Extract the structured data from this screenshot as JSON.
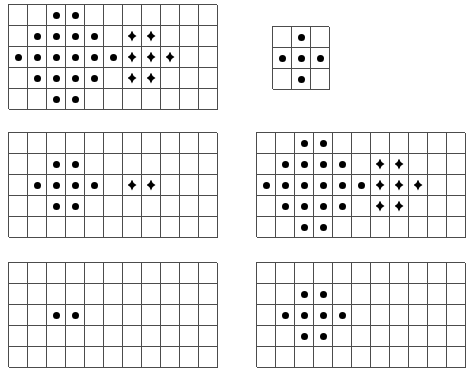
{
  "page": {
    "background_color": "#ffffff",
    "grid_line_color": "#4c4c4c",
    "marker_color": "#000000",
    "marker_types": [
      "dot",
      "diamond"
    ],
    "grid_count": 6
  },
  "legend": {
    "dot_label": "round-dot",
    "diamond_label": "diamond",
    "empty_label": "empty"
  },
  "grids": [
    {
      "name": "grid-top-left",
      "position": "top-left",
      "x": 8,
      "y": 4,
      "cols": 11,
      "rows": 5,
      "cell_w": 19,
      "cell_h": 21,
      "cells": [
        [
          "",
          "",
          "dot",
          "dot",
          "",
          "",
          "",
          "",
          "",
          "",
          ""
        ],
        [
          "",
          "dot",
          "dot",
          "dot",
          "dot",
          "",
          "diamond",
          "diamond",
          "",
          "",
          ""
        ],
        [
          "dot",
          "dot",
          "dot",
          "dot",
          "dot",
          "dot",
          "diamond",
          "diamond",
          "diamond",
          "",
          ""
        ],
        [
          "",
          "dot",
          "dot",
          "dot",
          "dot",
          "",
          "diamond",
          "diamond",
          "",
          "",
          ""
        ],
        [
          "",
          "",
          "dot",
          "dot",
          "",
          "",
          "",
          "",
          "",
          "",
          ""
        ]
      ],
      "dot_count": 18,
      "diamond_count": 7
    },
    {
      "name": "grid-top-right",
      "position": "top-right",
      "x": 272,
      "y": 26,
      "cols": 3,
      "rows": 3,
      "cell_w": 19,
      "cell_h": 21,
      "cells": [
        [
          "",
          "dot",
          ""
        ],
        [
          "dot",
          "dot",
          "dot"
        ],
        [
          "",
          "dot",
          ""
        ]
      ],
      "dot_count": 5,
      "diamond_count": 0
    },
    {
      "name": "grid-middle-left",
      "position": "middle-left",
      "x": 8,
      "y": 132,
      "cols": 11,
      "rows": 5,
      "cell_w": 19,
      "cell_h": 21,
      "cells": [
        [
          "",
          "",
          "",
          "",
          "",
          "",
          "",
          "",
          "",
          "",
          ""
        ],
        [
          "",
          "",
          "dot",
          "dot",
          "",
          "",
          "",
          "",
          "",
          "",
          ""
        ],
        [
          "",
          "dot",
          "dot",
          "dot",
          "dot",
          "",
          "diamond",
          "diamond",
          "",
          "",
          ""
        ],
        [
          "",
          "",
          "dot",
          "dot",
          "",
          "",
          "",
          "",
          "",
          "",
          ""
        ],
        [
          "",
          "",
          "",
          "",
          "",
          "",
          "",
          "",
          "",
          "",
          ""
        ]
      ],
      "dot_count": 8,
      "diamond_count": 2
    },
    {
      "name": "grid-middle-right",
      "position": "middle-right",
      "x": 256,
      "y": 132,
      "cols": 11,
      "rows": 5,
      "cell_w": 19,
      "cell_h": 21,
      "cells": [
        [
          "",
          "",
          "dot",
          "dot",
          "",
          "",
          "",
          "",
          "",
          "",
          ""
        ],
        [
          "",
          "dot",
          "dot",
          "dot",
          "dot",
          "",
          "diamond",
          "diamond",
          "",
          "",
          ""
        ],
        [
          "dot",
          "dot",
          "dot",
          "dot",
          "dot",
          "dot",
          "diamond",
          "diamond",
          "diamond",
          "",
          ""
        ],
        [
          "",
          "dot",
          "dot",
          "dot",
          "dot",
          "",
          "diamond",
          "diamond",
          "",
          "",
          ""
        ],
        [
          "",
          "",
          "dot",
          "dot",
          "",
          "",
          "",
          "",
          "",
          "",
          ""
        ]
      ],
      "dot_count": 18,
      "diamond_count": 7
    },
    {
      "name": "grid-bottom-left",
      "position": "bottom-left",
      "x": 8,
      "y": 262,
      "cols": 11,
      "rows": 5,
      "cell_w": 19,
      "cell_h": 21,
      "cells": [
        [
          "",
          "",
          "",
          "",
          "",
          "",
          "",
          "",
          "",
          "",
          ""
        ],
        [
          "",
          "",
          "",
          "",
          "",
          "",
          "",
          "",
          "",
          "",
          ""
        ],
        [
          "",
          "",
          "dot",
          "dot",
          "",
          "",
          "",
          "",
          "",
          "",
          ""
        ],
        [
          "",
          "",
          "",
          "",
          "",
          "",
          "",
          "",
          "",
          "",
          ""
        ],
        [
          "",
          "",
          "",
          "",
          "",
          "",
          "",
          "",
          "",
          "",
          ""
        ]
      ],
      "dot_count": 2,
      "diamond_count": 0
    },
    {
      "name": "grid-bottom-right",
      "position": "bottom-right",
      "x": 256,
      "y": 262,
      "cols": 11,
      "rows": 5,
      "cell_w": 19,
      "cell_h": 21,
      "cells": [
        [
          "",
          "",
          "",
          "",
          "",
          "",
          "",
          "",
          "",
          "",
          ""
        ],
        [
          "",
          "",
          "dot",
          "dot",
          "",
          "",
          "",
          "",
          "",
          "",
          ""
        ],
        [
          "",
          "dot",
          "dot",
          "dot",
          "dot",
          "",
          "",
          "",
          "",
          "",
          ""
        ],
        [
          "",
          "",
          "dot",
          "dot",
          "",
          "",
          "",
          "",
          "",
          "",
          ""
        ],
        [
          "",
          "",
          "",
          "",
          "",
          "",
          "",
          "",
          "",
          "",
          ""
        ]
      ],
      "dot_count": 8,
      "diamond_count": 0
    }
  ]
}
